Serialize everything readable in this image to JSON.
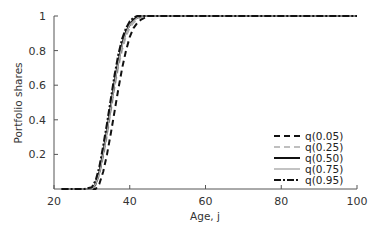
{
  "chart_data": {
    "type": "line",
    "title": "",
    "xlabel": "Age, j",
    "ylabel": "Portfolio shares",
    "xlim": [
      20,
      100
    ],
    "ylim": [
      0,
      1
    ],
    "xticks": [
      20,
      40,
      60,
      80,
      100
    ],
    "yticks": [
      0.2,
      0.4,
      0.6,
      0.8,
      1
    ],
    "ytick_labels": [
      "0.2",
      "0.4",
      "0.6",
      "0.8",
      "1"
    ],
    "grid": false,
    "legend_position": "lower right",
    "x": [
      22,
      28,
      30,
      31,
      32,
      33,
      34,
      35,
      36,
      37,
      38,
      39,
      40,
      41,
      42,
      43,
      44,
      45,
      46,
      50,
      60,
      70,
      80,
      90,
      100
    ],
    "series": [
      {
        "name": "q(0.05)",
        "style": "dashed",
        "color": "#111111",
        "values": [
          0,
          0,
          0,
          0.0,
          0.03,
          0.1,
          0.2,
          0.32,
          0.45,
          0.58,
          0.7,
          0.8,
          0.88,
          0.93,
          0.96,
          0.98,
          0.99,
          1,
          1,
          1,
          1,
          1,
          1,
          1,
          1
        ]
      },
      {
        "name": "q(0.25)",
        "style": "dashed",
        "color": "#aaaaaa",
        "values": [
          0,
          0,
          0,
          0.02,
          0.08,
          0.18,
          0.3,
          0.44,
          0.58,
          0.7,
          0.8,
          0.88,
          0.93,
          0.96,
          0.98,
          0.99,
          1,
          1,
          1,
          1,
          1,
          1,
          1,
          1,
          1
        ]
      },
      {
        "name": "q(0.50)",
        "style": "solid",
        "color": "#111111",
        "values": [
          0,
          0,
          0,
          0.03,
          0.1,
          0.21,
          0.34,
          0.48,
          0.62,
          0.74,
          0.84,
          0.91,
          0.95,
          0.98,
          0.99,
          1,
          1,
          1,
          1,
          1,
          1,
          1,
          1,
          1,
          1
        ]
      },
      {
        "name": "q(0.75)",
        "style": "solid",
        "color": "#aaaaaa",
        "values": [
          0,
          0,
          0,
          0.03,
          0.09,
          0.2,
          0.33,
          0.47,
          0.61,
          0.73,
          0.83,
          0.9,
          0.95,
          0.97,
          0.99,
          1,
          1,
          1,
          1,
          1,
          1,
          1,
          1,
          1,
          1
        ]
      },
      {
        "name": "q(0.95)",
        "style": "dashdot",
        "color": "#111111",
        "values": [
          0,
          0,
          0.01,
          0.05,
          0.13,
          0.25,
          0.38,
          0.52,
          0.66,
          0.78,
          0.87,
          0.93,
          0.97,
          0.99,
          1,
          1,
          1,
          1,
          1,
          1,
          1,
          1,
          1,
          1,
          1
        ]
      }
    ]
  }
}
